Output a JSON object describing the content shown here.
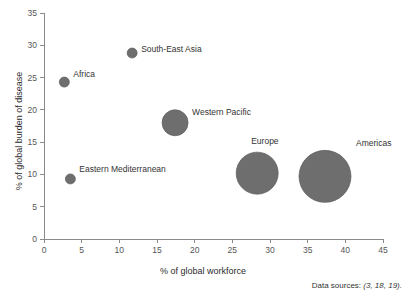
{
  "chart_data": {
    "type": "scatter",
    "title": "",
    "xlabel": "% of global workforce",
    "ylabel": "% of global burden of disease",
    "xlim": [
      0,
      45
    ],
    "ylim": [
      0,
      35
    ],
    "xticks": [
      "0",
      "5",
      "10",
      "15",
      "20",
      "25",
      "30",
      "35",
      "40",
      "45"
    ],
    "yticks": [
      "0",
      "5",
      "10",
      "15",
      "20",
      "25",
      "30",
      "35"
    ],
    "grid": false,
    "legend": "none",
    "bubble_size_meaning": "relative size of region",
    "series": [
      {
        "name": "WHO regions",
        "color": "#6e6e6e",
        "points": [
          {
            "label": "Africa",
            "x": 2.7,
            "y": 24.3,
            "r": 5,
            "label_dx": 9,
            "label_dy": -5
          },
          {
            "label": "South-East Asia",
            "x": 11.7,
            "y": 28.8,
            "r": 5,
            "label_dx": 9,
            "label_dy": -1
          },
          {
            "label": "Eastern Mediterranean",
            "x": 3.5,
            "y": 9.3,
            "r": 5,
            "label_dx": 9,
            "label_dy": -7
          },
          {
            "label": "Western Pacific",
            "x": 17.4,
            "y": 18.0,
            "r": 13,
            "label_dx": 17,
            "label_dy": -8
          },
          {
            "label": "Europe",
            "x": 28.3,
            "y": 10.2,
            "r": 21,
            "label_dx": -6,
            "label_dy": -29
          },
          {
            "label": "Americas",
            "x": 37.3,
            "y": 9.7,
            "r": 26,
            "label_dx": 31,
            "label_dy": -30
          }
        ]
      }
    ]
  },
  "footer": {
    "data_sources_label": "Data sources:",
    "data_sources_refs": "(3, 18, 19)."
  }
}
